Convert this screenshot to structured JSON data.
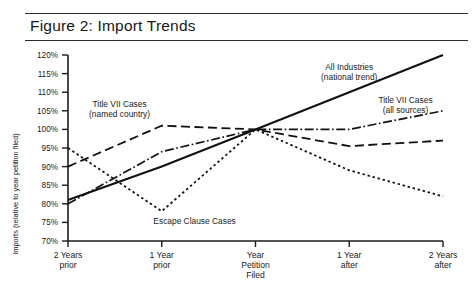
{
  "figure": {
    "title": "Figure 2:  Import Trends"
  },
  "chart_data": {
    "type": "line",
    "title": "Figure 2:  Import Trends",
    "xlabel": "",
    "ylabel": "Imports (relative to year petition filed)",
    "categories": [
      "2 Years prior",
      "1 Year prior",
      "Year Petition Filed",
      "1 Year after",
      "2 Years after"
    ],
    "category_lines": [
      [
        "2 Years",
        "prior"
      ],
      [
        "1 Year",
        "prior"
      ],
      [
        "Year",
        "Petition",
        "Filed"
      ],
      [
        "1 Year",
        "after"
      ],
      [
        "2 Years",
        "after"
      ]
    ],
    "ylim": [
      70,
      120
    ],
    "ytick_values": [
      70,
      75,
      80,
      85,
      90,
      95,
      100,
      105,
      110,
      115,
      120
    ],
    "ytick_labels": [
      "70%",
      "75%",
      "80%",
      "85%",
      "90%",
      "95%",
      "100%",
      "105%",
      "110%",
      "115%",
      "120%"
    ],
    "grid": false,
    "legend": "inline-annotations",
    "series": [
      {
        "name": "All Industries (national trend)",
        "label_lines": [
          "All Industries",
          "(national trend)"
        ],
        "style": "solid",
        "dasharray": "none",
        "width": 2.1,
        "values": [
          81,
          90,
          100,
          110,
          120
        ]
      },
      {
        "name": "Title VII Cases (all sources)",
        "label_lines": [
          "Title VII Cases",
          "(all sources)"
        ],
        "style": "dash-dot",
        "dasharray": "9,2.6,1.6,2.6",
        "width": 1.7,
        "values": [
          80,
          94,
          100,
          100,
          105
        ]
      },
      {
        "name": "Title VII Cases (named country)",
        "label_lines": [
          "Title VII Cases",
          "(named country)"
        ],
        "style": "dashed",
        "dasharray": "9,4.5",
        "width": 1.8,
        "values": [
          90,
          101,
          100,
          95.5,
          97
        ]
      },
      {
        "name": "Escape Clause Cases",
        "label_lines": [
          "Escape Clause Cases"
        ],
        "style": "dotted",
        "dasharray": "2.4,2.8",
        "width": 1.8,
        "values": [
          95,
          78,
          100,
          89,
          82
        ]
      }
    ],
    "annotations": [
      {
        "text": "All Industries (national trend)",
        "x_category": 3,
        "y_value": 116
      },
      {
        "text": "Title VII Cases (all sources)",
        "x_category": 3.6,
        "y_value": 107
      },
      {
        "text": "Title VII Cases (named country)",
        "x_category": 0.55,
        "y_value": 106
      },
      {
        "text": "Escape Clause Cases",
        "x_category": 1.35,
        "y_value": 74.5
      }
    ],
    "colors": {
      "line": "#111111",
      "axis": "#1a1a1a",
      "background": "#ffffff",
      "text": "#1a1a1a"
    }
  }
}
